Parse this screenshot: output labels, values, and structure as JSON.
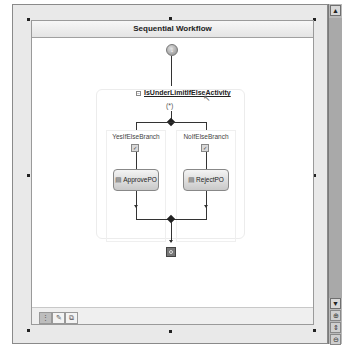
{
  "workflow": {
    "title": "Sequential Workflow",
    "ifelse_activity": {
      "name": "IsUnderLimitIfElseActivity",
      "collapse_symbol": "−",
      "condition_symbol": "(*)"
    },
    "branches": [
      {
        "label": "YesIfElseBranch",
        "activity": "ApprovePO"
      },
      {
        "label": "NoIfElseBranch",
        "activity": "RejectPO"
      }
    ],
    "start_symbol": "↓"
  },
  "view_tabs": [
    {
      "label": "⋮",
      "name": "workflow-view",
      "active": true
    },
    {
      "label": "✎",
      "name": "cancel-handler-view",
      "active": false
    },
    {
      "label": "⧉",
      "name": "fault-handlers-view",
      "active": false
    }
  ],
  "scrollbar": {
    "up": "▲",
    "down": "▼"
  },
  "zoom_tools": [
    {
      "label": "⊕",
      "name": "zoom-in"
    },
    {
      "label": "⇕",
      "name": "pan"
    },
    {
      "label": "⊖",
      "name": "zoom-out"
    }
  ]
}
